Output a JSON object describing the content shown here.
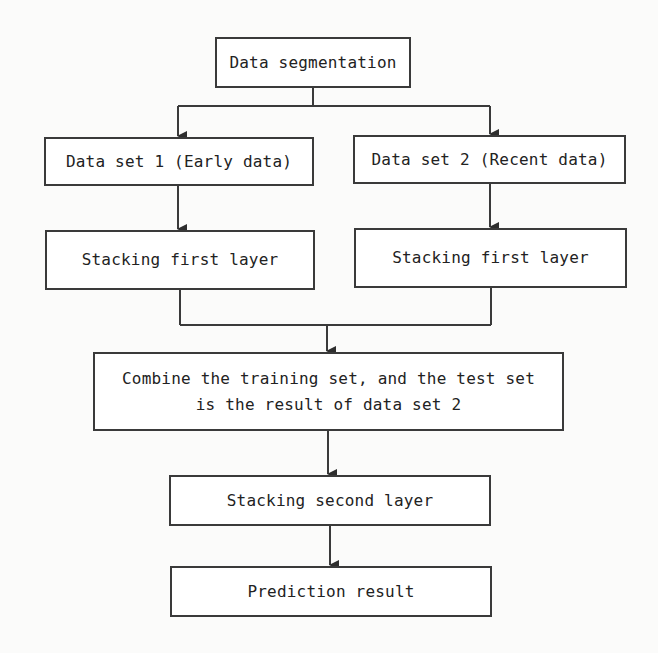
{
  "diagram": {
    "type": "flowchart",
    "nodes": [
      {
        "id": "seg",
        "label": "Data segmentation"
      },
      {
        "id": "ds1",
        "label": "Data set 1 (Early data)"
      },
      {
        "id": "ds2",
        "label": "Data set 2 (Recent data)"
      },
      {
        "id": "sf1",
        "label": "Stacking first layer"
      },
      {
        "id": "sf2",
        "label": "Stacking first layer"
      },
      {
        "id": "comb",
        "label_line1": "Combine the training set, and the test set",
        "label_line2": "is the result of data set 2"
      },
      {
        "id": "ss",
        "label": "Stacking second layer"
      },
      {
        "id": "pred",
        "label": "Prediction result"
      }
    ],
    "edges": [
      {
        "from": "seg",
        "to": "ds1"
      },
      {
        "from": "seg",
        "to": "ds2"
      },
      {
        "from": "ds1",
        "to": "sf1"
      },
      {
        "from": "ds2",
        "to": "sf2"
      },
      {
        "from": "sf1",
        "to": "comb"
      },
      {
        "from": "sf2",
        "to": "comb"
      },
      {
        "from": "comb",
        "to": "ss"
      },
      {
        "from": "ss",
        "to": "pred"
      }
    ],
    "colors": {
      "line": "#3a3a3a",
      "box_fill": "#ffffff",
      "text": "#222222"
    }
  }
}
